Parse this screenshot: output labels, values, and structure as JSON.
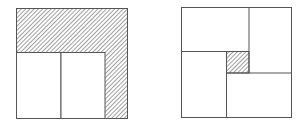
{
  "figures": [
    {
      "name": "left-figure",
      "description": "Square with L-shaped hatched border region on top and right; two white rectangles at bottom-left",
      "outer": {
        "x": 16,
        "y": 8,
        "w": 112,
        "h": 111
      },
      "hatched_region": "L-shape (top band and right band)",
      "white_rects": [
        {
          "x": 16,
          "y": 52,
          "w": 45,
          "h": 67
        },
        {
          "x": 61,
          "y": 52,
          "w": 44,
          "h": 67
        }
      ]
    },
    {
      "name": "right-figure",
      "description": "Square divided into four rectangles in pinwheel arrangement around a small hatched central square",
      "outer": {
        "x": 181,
        "y": 7,
        "w": 111,
        "h": 111
      },
      "rects": [
        {
          "x": 181,
          "y": 7,
          "w": 68,
          "h": 44
        },
        {
          "x": 249,
          "y": 7,
          "w": 43,
          "h": 66
        },
        {
          "x": 226,
          "y": 73,
          "w": 66,
          "h": 45
        },
        {
          "x": 181,
          "y": 51,
          "w": 45,
          "h": 67
        }
      ],
      "hatched_center": {
        "x": 226,
        "y": 51,
        "w": 23,
        "h": 22
      }
    }
  ],
  "colors": {
    "stroke": "#555555",
    "hatch": "#777777",
    "background": "#ffffff"
  }
}
